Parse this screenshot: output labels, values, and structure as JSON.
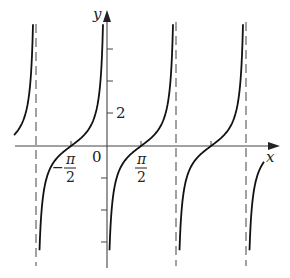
{
  "diagram": {
    "type": "function-graph",
    "function_description": "y = -cot(x) style periodic curve with vertical asymptotes at multiples of pi",
    "axes": {
      "x_label": "x",
      "y_label": "y",
      "origin_label": "0"
    },
    "x_tick_labels": [
      {
        "numerator": "π",
        "denominator": "2",
        "sign": "−"
      },
      {
        "numerator": "π",
        "denominator": "2",
        "sign": ""
      }
    ],
    "y_tick_label": "2",
    "colors": {
      "curve": "#111111",
      "axis": "#444444",
      "asymptote": "#555555",
      "background": "#ffffff"
    }
  }
}
